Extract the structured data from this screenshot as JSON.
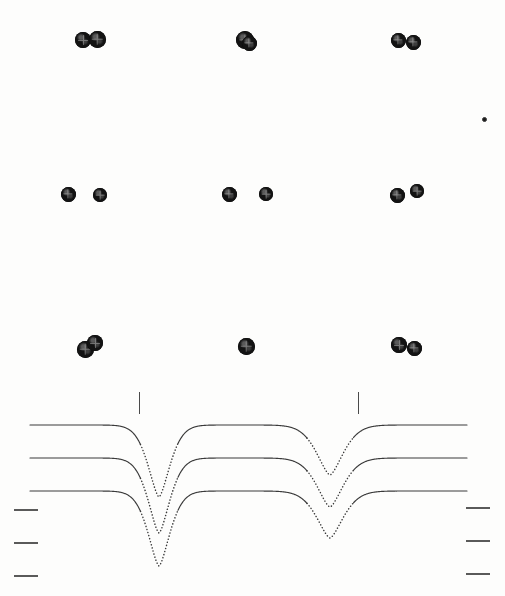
{
  "figure": {
    "type": "stacked-absorption-spectra-with-schematics",
    "background_color": "#fdfdfc",
    "ink_color": "#131313",
    "line_color": "#3a3a3a",
    "tick_color": "#5a5a5a"
  },
  "schematic": {
    "label": "marker-grid",
    "rows": [
      {
        "row_index": 0,
        "y": 40,
        "clusters": [
          {
            "cx": 83,
            "cy": 40,
            "r": 8,
            "icon": "dark-disc-marker"
          },
          {
            "cx": 97,
            "cy": 39,
            "r": 8.5,
            "icon": "dark-disc-marker"
          },
          {
            "cx": 245,
            "cy": 40,
            "r": 9,
            "icon": "dark-disc-marker"
          },
          {
            "cx": 249,
            "cy": 43,
            "r": 7.5,
            "icon": "dark-disc-marker"
          },
          {
            "cx": 398,
            "cy": 40,
            "r": 7.5,
            "icon": "dark-disc-marker"
          },
          {
            "cx": 413,
            "cy": 42,
            "r": 7.5,
            "icon": "dark-disc-marker"
          }
        ]
      },
      {
        "row_index": 1,
        "y": 194,
        "clusters": [
          {
            "cx": 68,
            "cy": 194,
            "r": 7.5,
            "icon": "dark-disc-marker"
          },
          {
            "cx": 100,
            "cy": 195,
            "r": 7,
            "icon": "dark-disc-marker"
          },
          {
            "cx": 229,
            "cy": 194,
            "r": 7.5,
            "icon": "dark-disc-marker"
          },
          {
            "cx": 266,
            "cy": 194,
            "r": 7,
            "icon": "dark-disc-marker"
          },
          {
            "cx": 397,
            "cy": 195,
            "r": 7.5,
            "icon": "dark-disc-marker"
          },
          {
            "cx": 417,
            "cy": 191,
            "r": 7,
            "icon": "dark-disc-marker"
          }
        ]
      },
      {
        "row_index": 2,
        "y": 347,
        "clusters": [
          {
            "cx": 85,
            "cy": 349,
            "r": 8.5,
            "icon": "dark-disc-marker"
          },
          {
            "cx": 95,
            "cy": 343,
            "r": 8,
            "icon": "dark-disc-marker"
          },
          {
            "cx": 246,
            "cy": 346,
            "r": 8.5,
            "icon": "dark-disc-marker"
          },
          {
            "cx": 399,
            "cy": 345,
            "r": 8,
            "icon": "dark-disc-marker"
          },
          {
            "cx": 414,
            "cy": 348,
            "r": 7.5,
            "icon": "dark-disc-marker"
          }
        ]
      }
    ],
    "isolated_dot": {
      "cx": 484,
      "cy": 119,
      "r": 2.5,
      "icon": "small-dot-marker"
    }
  },
  "chart_data": {
    "type": "line",
    "title": "",
    "subtitle": "",
    "xlabel": "",
    "ylabel": "",
    "grid": false,
    "legend": "none",
    "panel_origin": {
      "x": 0,
      "y": 380
    },
    "panel_size": {
      "width": 505,
      "height": 216
    },
    "xlim": [
      0,
      505
    ],
    "ylim_pixels": [
      596,
      380
    ],
    "x_domain_px": [
      30,
      467
    ],
    "line_style": "solid-continuum-with-dotted-dips",
    "series": [
      {
        "name": "curve-top",
        "index": 0,
        "baseline_y": 425,
        "x_start": 30,
        "x_end": 467,
        "dips": [
          {
            "name": "dip-left",
            "center_x": 159,
            "depth_y": 497,
            "half_width_px": 18,
            "style": "dotted"
          },
          {
            "name": "dip-right",
            "center_x": 330,
            "depth_y": 475,
            "half_width_px": 22,
            "style": "dotted"
          }
        ]
      },
      {
        "name": "curve-middle",
        "index": 1,
        "baseline_y": 458,
        "x_start": 30,
        "x_end": 467,
        "dips": [
          {
            "name": "dip-left",
            "center_x": 159,
            "depth_y": 533,
            "half_width_px": 18,
            "style": "dotted"
          },
          {
            "name": "dip-right",
            "center_x": 330,
            "depth_y": 507,
            "half_width_px": 22,
            "style": "dotted"
          }
        ]
      },
      {
        "name": "curve-bottom",
        "index": 2,
        "baseline_y": 491,
        "x_start": 30,
        "x_end": 467,
        "dips": [
          {
            "name": "dip-left",
            "center_x": 159,
            "depth_y": 566,
            "half_width_px": 18,
            "style": "dotted"
          },
          {
            "name": "dip-right",
            "center_x": 330,
            "depth_y": 538,
            "half_width_px": 22,
            "style": "dotted"
          }
        ]
      }
    ],
    "vertical_markers": [
      {
        "name": "marker-left",
        "x": 139,
        "y_top": 392,
        "y_bottom": 414
      },
      {
        "name": "marker-right",
        "x": 358,
        "y_top": 392,
        "y_bottom": 414
      }
    ],
    "left_axis_ticks": [
      {
        "y": 509,
        "x": 14,
        "length": 24
      },
      {
        "y": 542,
        "x": 14,
        "length": 24
      },
      {
        "y": 575,
        "x": 14,
        "length": 24
      }
    ],
    "right_axis_ticks": [
      {
        "y": 507,
        "x": 466,
        "length": 24
      },
      {
        "y": 540,
        "x": 466,
        "length": 24
      },
      {
        "y": 573,
        "x": 466,
        "length": 24
      }
    ]
  }
}
